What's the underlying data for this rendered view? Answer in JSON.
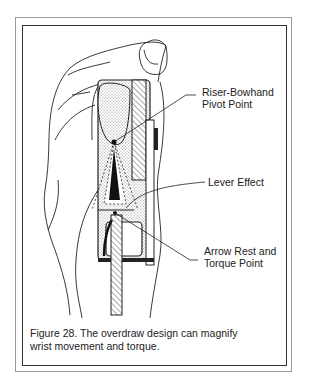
{
  "figure": {
    "labels": {
      "pivot_line1": "Riser-Bowhand",
      "pivot_line2": "Pivot Point",
      "lever": "Lever Effect",
      "rest_line1": "Arrow Rest and",
      "rest_line2": "Torque Point"
    },
    "caption_line1": "Figure 28.  The overdraw design can magnify",
    "caption_line2": "wrist movement and torque."
  }
}
